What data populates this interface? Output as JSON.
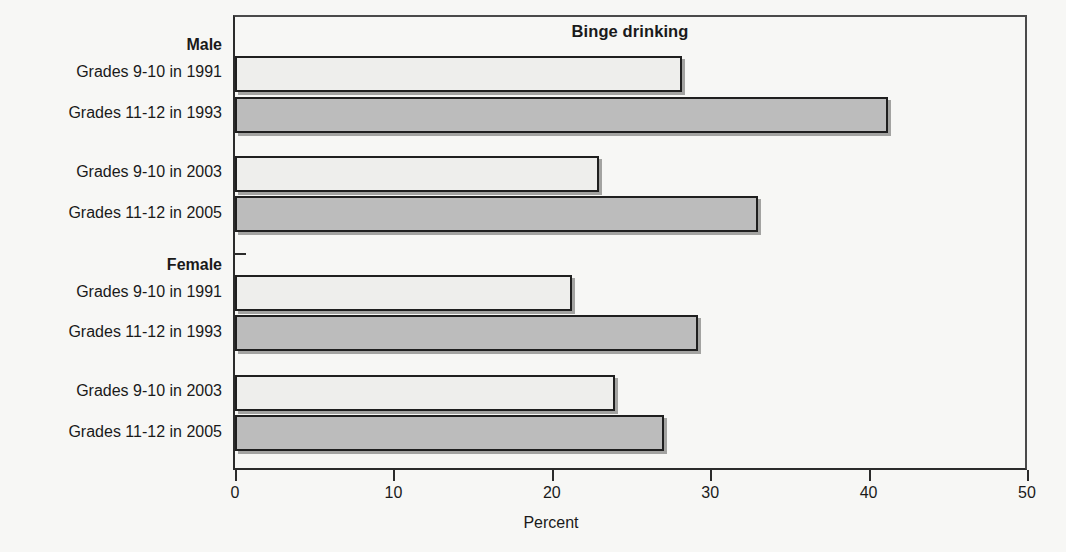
{
  "chart_data": {
    "type": "bar",
    "orientation": "horizontal",
    "title": "Binge drinking",
    "xlabel": "Percent",
    "ylabel": "",
    "xlim": [
      0,
      50
    ],
    "xticks": [
      0,
      10,
      20,
      30,
      40,
      50
    ],
    "xtick_labels": [
      "0",
      "10",
      "20",
      "30",
      "40",
      "50"
    ],
    "grid": false,
    "legend": false,
    "groups": [
      {
        "name": "Male",
        "bars": [
          {
            "label": "Grades 9-10 in 1991",
            "value": 28.2,
            "style": "light"
          },
          {
            "label": "Grades 11-12 in 1993",
            "value": 41.2,
            "style": "dark"
          },
          {
            "label": "Grades 9-10 in 2003",
            "value": 23.0,
            "style": "light"
          },
          {
            "label": "Grades 11-12 in 2005",
            "value": 33.0,
            "style": "dark"
          }
        ]
      },
      {
        "name": "Female",
        "bars": [
          {
            "label": "Grades 9-10 in 1991",
            "value": 21.3,
            "style": "light"
          },
          {
            "label": "Grades 11-12 in 1993",
            "value": 29.2,
            "style": "dark"
          },
          {
            "label": "Grades 9-10 in 2003",
            "value": 24.0,
            "style": "light"
          },
          {
            "label": "Grades 11-12 in 2005",
            "value": 27.1,
            "style": "dark"
          }
        ]
      }
    ],
    "categories": [
      "Male Grades 9-10 in 1991",
      "Male Grades 11-12 in 1993",
      "Male Grades 9-10 in 2003",
      "Male Grades 11-12 in 2005",
      "Female Grades 9-10 in 1991",
      "Female Grades 11-12 in 1993",
      "Female Grades 9-10 in 2003",
      "Female Grades 11-12 in 2005"
    ],
    "values": [
      28.2,
      41.2,
      23.0,
      33.0,
      21.3,
      29.2,
      24.0,
      27.1
    ],
    "colors": {
      "light_bar": "#eeeeec",
      "dark_bar": "#bcbcbc",
      "bar_outline": "#1f1f1f",
      "axis": "#2b2b2b",
      "background": "#f7f7f5"
    }
  },
  "labels": {
    "group_male": "Male",
    "group_female": "Female",
    "male_1": "Grades 9-10 in 1991",
    "male_2": "Grades 11-12 in 1993",
    "male_3": "Grades 9-10 in 2003",
    "male_4": "Grades 11-12 in 2005",
    "female_1": "Grades 9-10 in 1991",
    "female_2": "Grades 11-12 in 1993",
    "female_3": "Grades 9-10 in 2003",
    "female_4": "Grades 11-12 in 2005"
  },
  "axis": {
    "title": "Percent",
    "tick_0": "0",
    "tick_10": "10",
    "tick_20": "20",
    "tick_30": "30",
    "tick_40": "40",
    "tick_50": "50"
  },
  "chart": {
    "title": "Binge drinking"
  }
}
